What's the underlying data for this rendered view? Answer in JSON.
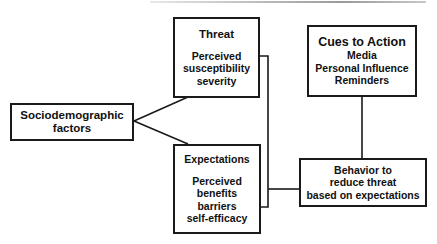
{
  "diagram": {
    "type": "flow-diagram",
    "nodes": {
      "sociodemographic": {
        "lines": [
          "Sociodemographic",
          "factors"
        ]
      },
      "threat": {
        "title": "Threat",
        "lines": [
          "Perceived",
          "susceptibility",
          "severity"
        ]
      },
      "expectations": {
        "title": "Expectations",
        "lines": [
          "Perceived",
          "benefits",
          "barriers",
          "self-efficacy"
        ]
      },
      "cues": {
        "title": "Cues to Action",
        "lines": [
          "Media",
          "Personal Influence",
          "Reminders"
        ]
      },
      "behavior": {
        "lines": [
          "Behavior to",
          "reduce threat",
          "based on expectations"
        ]
      }
    },
    "edges": [
      {
        "from": "sociodemographic",
        "to": "threat"
      },
      {
        "from": "sociodemographic",
        "to": "expectations"
      },
      {
        "from": "threat",
        "to": "behavior"
      },
      {
        "from": "expectations",
        "to": "behavior"
      },
      {
        "from": "cues",
        "to": "behavior"
      }
    ],
    "colors": {
      "stroke": "#1a1a1a",
      "background": "#ffffff"
    }
  }
}
